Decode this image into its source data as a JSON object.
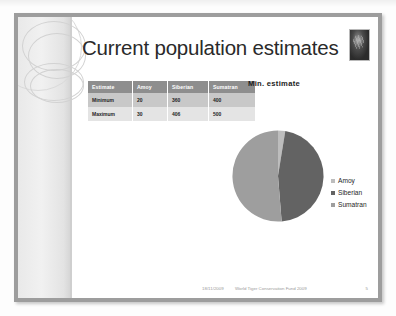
{
  "slide": {
    "title": "Current population estimates",
    "corner_image_name": "tiger-photo"
  },
  "table": {
    "headers": [
      "Estimate",
      "Amoy",
      "Siberian",
      "Sumatran"
    ],
    "rows": [
      {
        "cells": [
          "Minimum",
          "20",
          "360",
          "400"
        ]
      },
      {
        "cells": [
          "Maximum",
          "30",
          "406",
          "500"
        ]
      }
    ]
  },
  "chart_data": {
    "type": "pie",
    "title": "Min. estimate",
    "categories": [
      "Amoy",
      "Siberian",
      "Sumatran"
    ],
    "values": [
      20,
      360,
      400
    ],
    "colors": [
      "#bdbdbd",
      "#636363",
      "#9e9e9e"
    ],
    "legend_position": "right",
    "grid": false,
    "xlabel": "",
    "ylabel": ""
  },
  "legend": {
    "entries": [
      {
        "label": "Amoy",
        "color": "#bdbdbd"
      },
      {
        "label": "Siberian",
        "color": "#636363"
      },
      {
        "label": "Sumatran",
        "color": "#9e9e9e"
      }
    ]
  },
  "footer": {
    "date": "18/11/2009",
    "text": "World Tiger Conservation Fund 2009",
    "page": "5"
  }
}
